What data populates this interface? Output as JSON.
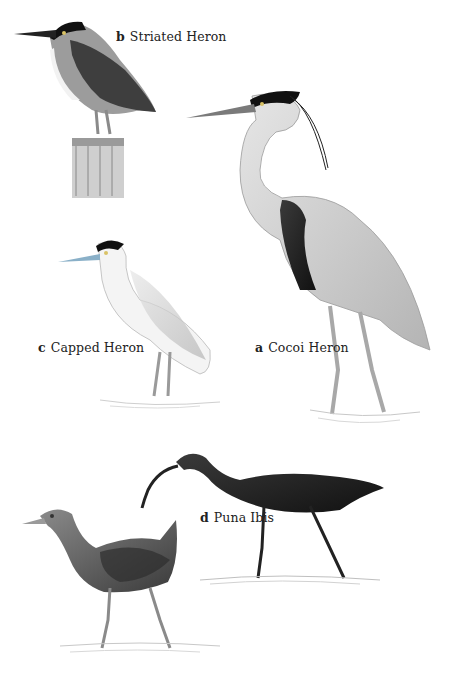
{
  "plate": {
    "background": "#ffffff",
    "birds": [
      {
        "letter": "a",
        "name": "Cocoi Heron"
      },
      {
        "letter": "b",
        "name": "Striated Heron"
      },
      {
        "letter": "c",
        "name": "Capped Heron"
      },
      {
        "letter": "d",
        "name": "Puna Ibis"
      }
    ],
    "unlabeled": [
      "rail (bottom-left, gray with rufous-gray neck)"
    ]
  }
}
